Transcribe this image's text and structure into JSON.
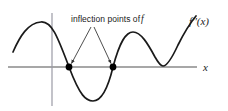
{
  "figure": {
    "background_color": "#ffffff",
    "width": 228,
    "height": 111
  },
  "annotations": {
    "inflection_note_text": "inflection points of",
    "inflection_note_var": "f",
    "curve_label": "f''(x)",
    "axis_label_x": "x"
  },
  "chart_data": {
    "type": "line",
    "title": "",
    "subtitle": "",
    "xlabel": "x",
    "ylabel": "",
    "grid": false,
    "legend": null,
    "axis_color": "#8a8a8a",
    "curve_color": "#1a1a1a",
    "marker_color": "#000000",
    "series": [
      {
        "name": "f''(x)",
        "label": "f''(x)",
        "color": "#1a1a1a",
        "path": "M 13,52 C 20,36 28,23 41,22 C 52,21 58,38 69,67 C 80,96 86,101 93,101 C 102,101 108,88 113,67 C 120,41 126,32 133,32 C 141,32 148,44 155,57 C 159,64 161,66 163,66 C 167,66 172,58 178,45 C 185,31 191,22 196,16"
      }
    ],
    "markers": [
      {
        "name": "inflection-point-left",
        "x": 69,
        "y": 67,
        "radius": 3.4,
        "label": "inflection point of f"
      },
      {
        "name": "inflection-point-right",
        "x": 113,
        "y": 67,
        "radius": 3.4,
        "label": "inflection point of f"
      }
    ],
    "axes": {
      "x_axis": {
        "x1": 8,
        "y1": 67,
        "x2": 197,
        "y2": 67
      },
      "y_axis": {
        "x1": 52,
        "y1": 13,
        "x2": 52,
        "y2": 106
      }
    },
    "annotation_arrows": [
      {
        "name": "arrow-to-left-inflection",
        "x1": 91,
        "y1": 27,
        "x2": 71.5,
        "y2": 63.5
      },
      {
        "name": "arrow-to-right-inflection",
        "x1": 94,
        "y1": 27,
        "x2": 111,
        "y2": 63.5
      }
    ]
  }
}
